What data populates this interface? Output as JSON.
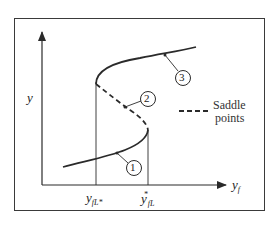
{
  "diagram": {
    "type": "bifurcation / multiple steady states curve",
    "axes": {
      "y_label": "y",
      "x_label": "y",
      "x_label_sub": "f"
    },
    "x_ticks": [
      {
        "label": "y",
        "sub": "fL",
        "sup": "*",
        "note": "lower turning point (left vertical line)"
      },
      {
        "label": "y",
        "sub": "fL",
        "sup": "*",
        "note": "upper turning point (right vertical line)"
      }
    ],
    "branches": [
      {
        "id": "1",
        "label": "1",
        "style": "solid",
        "description": "lower stable branch"
      },
      {
        "id": "2",
        "label": "2",
        "style": "dashed",
        "description": "middle unstable branch (saddle points)"
      },
      {
        "id": "3",
        "label": "3",
        "style": "solid",
        "description": "upper stable branch"
      }
    ],
    "legend": {
      "line1": "Saddle",
      "line2": "points",
      "style": "dashed"
    },
    "colors": {
      "line": "#2a2a2a",
      "frame": "#3a3a3a",
      "background": "#ffffff"
    }
  }
}
